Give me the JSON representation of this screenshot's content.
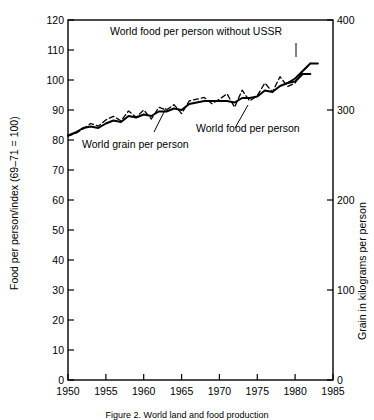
{
  "figure": {
    "caption": "Figure 2. World land and food production"
  },
  "chart_data": {
    "type": "line",
    "title": "",
    "xlabel": "",
    "ylabel": "Food per person/index (69–71 = 100)",
    "y2label": "Grain in kilograms per person",
    "xlim": [
      1950,
      1985
    ],
    "ylim": [
      0,
      120
    ],
    "y2lim": [
      0,
      400
    ],
    "grid": false,
    "legend_position": "inline-annotations",
    "xticks": [
      1950,
      1955,
      1960,
      1965,
      1970,
      1975,
      1980,
      1985
    ],
    "xtick_labels": [
      "1950",
      "1955",
      "1960",
      "1965",
      "1970",
      "1975",
      "1980",
      "1985"
    ],
    "yticks": [
      0,
      10,
      20,
      30,
      40,
      50,
      60,
      70,
      80,
      90,
      100,
      110,
      120
    ],
    "ytick_labels": [
      "0",
      "10",
      "20",
      "30",
      "40",
      "50",
      "60",
      "70",
      "80",
      "90",
      "100",
      "110",
      "120"
    ],
    "y2ticks": [
      0,
      100,
      200,
      300,
      400
    ],
    "y2tick_labels": [
      "0",
      "100",
      "200",
      "300",
      "400"
    ],
    "annotations": [
      {
        "text": "World food per person without USSR",
        "x": 1963.5,
        "y": 116
      },
      {
        "text": "World food per person",
        "x": 1970.2,
        "y": 93.5
      },
      {
        "text": "World grain per person",
        "x": 1954.0,
        "y": 81.5
      }
    ],
    "series": [
      {
        "name": "World food per person",
        "style": "solid",
        "axis": "left",
        "x": [
          1950,
          1951,
          1952,
          1953,
          1954,
          1955,
          1956,
          1957,
          1958,
          1959,
          1960,
          1961,
          1962,
          1963,
          1964,
          1965,
          1966,
          1967,
          1968,
          1969,
          1970,
          1971,
          1972,
          1973,
          1974,
          1975,
          1976,
          1977,
          1978,
          1979,
          1980,
          1981,
          1982
        ],
        "y": [
          81.5,
          82.5,
          84.0,
          84.5,
          84.0,
          85.5,
          86.5,
          86.0,
          88.0,
          87.5,
          88.5,
          88.0,
          89.5,
          89.5,
          90.5,
          90.0,
          92.0,
          92.5,
          93.0,
          93.0,
          93.0,
          93.0,
          92.5,
          94.0,
          94.0,
          94.5,
          96.5,
          96.0,
          98.0,
          99.0,
          99.5,
          102.0,
          102.0
        ]
      },
      {
        "name": "World grain per person",
        "style": "dashed",
        "axis": "right",
        "x": [
          1950,
          1951,
          1952,
          1953,
          1954,
          1955,
          1956,
          1957,
          1958,
          1959,
          1960,
          1961,
          1962,
          1963,
          1964,
          1965,
          1966,
          1967,
          1968,
          1969,
          1970,
          1971,
          1972,
          1973,
          1974,
          1975,
          1976,
          1977,
          1978,
          1979,
          1980,
          1981,
          1982
        ],
        "y": [
          271,
          274,
          279,
          285,
          282,
          289,
          293,
          288,
          299,
          292,
          300,
          290,
          303,
          300,
          306,
          296,
          310,
          312,
          314,
          307,
          312,
          318,
          303,
          322,
          310,
          316,
          330,
          320,
          337,
          326,
          330,
          343,
          352
        ]
      },
      {
        "name": "World food per person without USSR",
        "style": "solid",
        "axis": "left",
        "x": [
          1979,
          1980,
          1981,
          1982,
          1983
        ],
        "y": [
          99.0,
          100.5,
          103.0,
          105.5,
          105.5
        ]
      }
    ]
  }
}
